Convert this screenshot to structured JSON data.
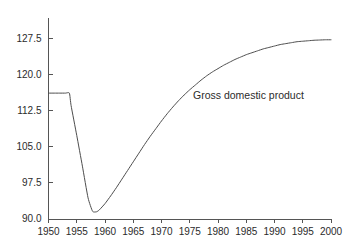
{
  "chart_data": {
    "type": "line",
    "title": "",
    "xlabel": "",
    "ylabel": "",
    "xlim": [
      1950,
      2000
    ],
    "ylim": [
      90.0,
      131.0
    ],
    "grid": false,
    "legend_position": "inline-annotation",
    "xticks": [
      1950,
      1955,
      1960,
      1965,
      1970,
      1975,
      1980,
      1985,
      1990,
      1995,
      2000
    ],
    "xtick_labels": [
      "1950",
      "1955",
      "1960",
      "1965",
      "1970",
      "1975",
      "1980",
      "1985",
      "1990",
      "1995",
      "2000"
    ],
    "yticks": [
      90.0,
      97.5,
      105.0,
      112.5,
      120.0,
      127.5
    ],
    "ytick_labels": [
      "90.0",
      "97.5",
      "105.0",
      "112.5",
      "120.0",
      "127.5"
    ],
    "series": [
      {
        "name": "Gross domestic product",
        "color": "#4d4d4d",
        "annotation": "Gross domestic product",
        "x": [
          1950,
          1951,
          1952,
          1953,
          1953.7,
          1954,
          1955,
          1956,
          1957,
          1957.8,
          1958.5,
          1959,
          1960,
          1961,
          1962,
          1963,
          1964,
          1965,
          1966,
          1967,
          1968,
          1969,
          1970,
          1971,
          1972,
          1973,
          1974,
          1975,
          1976,
          1977,
          1978,
          1979,
          1980,
          1981,
          1982,
          1983,
          1984,
          1985,
          1986,
          1987,
          1988,
          1989,
          1990,
          1991,
          1992,
          1993,
          1994,
          1995,
          1996,
          1997,
          1998,
          1999,
          2000
        ],
        "y": [
          116.2,
          116.2,
          116.2,
          116.2,
          116.2,
          113.6,
          107.4,
          101.0,
          94.4,
          91.6,
          91.5,
          91.9,
          93.2,
          94.8,
          96.5,
          98.3,
          100.1,
          101.9,
          103.7,
          105.5,
          107.2,
          108.8,
          110.4,
          111.9,
          113.3,
          114.6,
          115.8,
          116.9,
          117.9,
          118.9,
          119.8,
          120.6,
          121.3,
          122.0,
          122.6,
          123.2,
          123.7,
          124.2,
          124.6,
          125.0,
          125.4,
          125.7,
          126.0,
          126.3,
          126.5,
          126.7,
          126.9,
          127.0,
          127.1,
          127.2,
          127.25,
          127.3,
          127.3
        ]
      }
    ],
    "axis_color": "#555555",
    "text_color": "#2b2b2b",
    "background": "#ffffff"
  }
}
